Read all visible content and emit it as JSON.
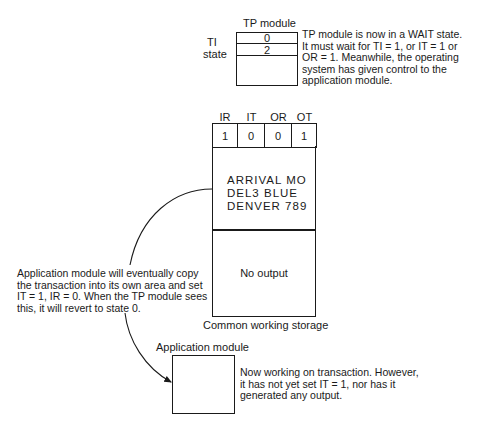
{
  "tp_module": {
    "title": "TP module",
    "side_label_1": "TI",
    "side_label_2": "state",
    "rows": [
      "0",
      "2",
      ""
    ],
    "note_lines": [
      "TP module is now in a WAIT state.",
      "It must wait for TI = 1, or IT = 1 or",
      "OR = 1. Meanwhile, the operating",
      "system has given control to the",
      "application module."
    ]
  },
  "common_storage": {
    "flag_headers": [
      "IR",
      "IT",
      "OR",
      "OT"
    ],
    "flag_values": [
      "1",
      "0",
      "0",
      "1"
    ],
    "input_lines": [
      "ARRIVAL MO",
      "DEL3 BLUE",
      "DENVER 789"
    ],
    "output_text": "No output",
    "caption": "Common working storage"
  },
  "copy_note": {
    "lines": [
      "Application module will eventually copy",
      "the transaction into its own area and set",
      "IT = 1, IR = 0. When the TP module sees",
      "this, it will revert to state 0."
    ]
  },
  "application_module": {
    "title": "Application module",
    "note_lines": [
      "Now working on transaction. However,",
      "it has not yet set IT = 1, nor has it",
      "generated any output."
    ]
  },
  "colors": {
    "ink": "#1a1a1a",
    "background": "#ffffff"
  }
}
